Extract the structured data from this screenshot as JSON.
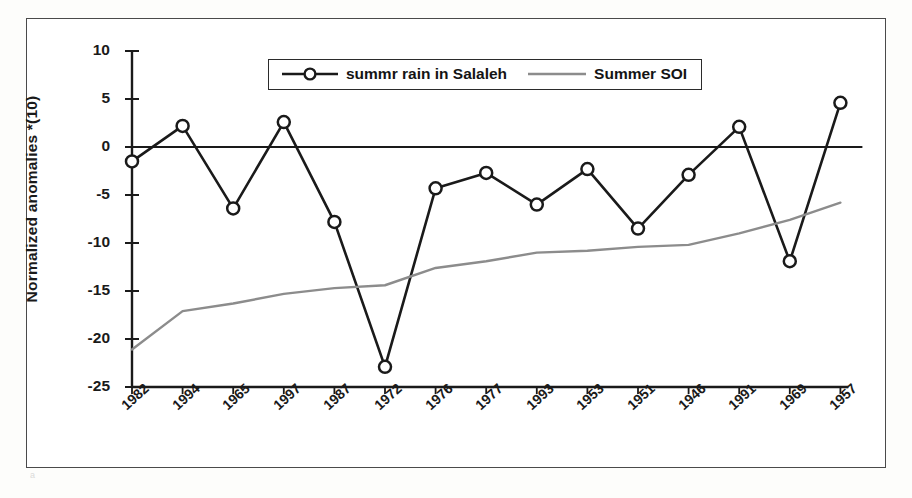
{
  "figure": {
    "background_color": "#ffffff",
    "frame_color": "#4a4a4a"
  },
  "chart_data": {
    "type": "line",
    "title": "",
    "subtitle": "",
    "xlabel": "",
    "ylabel": "Normalized anomalies *(10)",
    "categories": [
      "1982",
      "1994",
      "1965",
      "1997",
      "1987",
      "1972",
      "1976",
      "1977",
      "1993",
      "1953",
      "1951",
      "1946",
      "1991",
      "1969",
      "1957"
    ],
    "yticks": [
      10,
      5,
      0,
      -5,
      -10,
      -15,
      -20,
      -25
    ],
    "ylim": [
      -25,
      10
    ],
    "grid": false,
    "zero_line": true,
    "legend_position": "top-center",
    "series": [
      {
        "name": "summr rain in Salaleh",
        "color": "#1a1a1a",
        "marker": "open-circle",
        "values": [
          -1.5,
          2.2,
          -6.4,
          2.6,
          -7.8,
          -22.9,
          -4.3,
          -2.7,
          -6.0,
          -2.3,
          -8.5,
          -2.9,
          2.1,
          -11.9,
          4.6
        ]
      },
      {
        "name": "Summer SOI",
        "color": "#8c8c8c",
        "marker": "none",
        "values": [
          -21.1,
          -17.1,
          -16.3,
          -15.3,
          -14.7,
          -14.4,
          -12.6,
          -11.9,
          -11.0,
          -10.8,
          -10.4,
          -10.2,
          -9.0,
          -7.6,
          -5.8
        ]
      }
    ]
  },
  "legend": {
    "items": [
      {
        "label": "summr rain in Salaleh",
        "color": "#1a1a1a",
        "style": "line-marker"
      },
      {
        "label": "Summer SOI",
        "color": "#8c8c8c",
        "style": "line"
      }
    ]
  },
  "axis": {
    "y_title": "Normalized anomalies *(10)",
    "y_tick_labels": [
      "10",
      "5",
      "0",
      "-5",
      "-10",
      "-15",
      "-20",
      "-25"
    ],
    "x_tick_labels": [
      "1982",
      "1994",
      "1965",
      "1997",
      "1987",
      "1972",
      "1976",
      "1977",
      "1993",
      "1953",
      "1951",
      "1946",
      "1991",
      "1969",
      "1957"
    ]
  }
}
